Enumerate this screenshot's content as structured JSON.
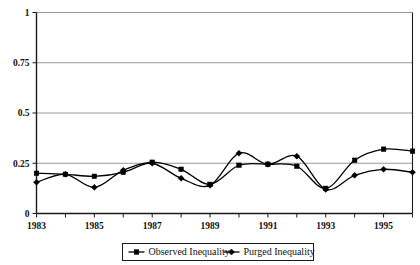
{
  "chart_data": {
    "type": "line",
    "title": "",
    "xlabel": "",
    "ylabel": "",
    "x": [
      1983,
      1984,
      1985,
      1986,
      1987,
      1988,
      1989,
      1990,
      1991,
      1992,
      1993,
      1994,
      1995,
      1996
    ],
    "xlim": [
      1983,
      1996
    ],
    "ylim": [
      0,
      1
    ],
    "yticks": [
      "0",
      "0.25",
      "0.5",
      "0.75",
      "1"
    ],
    "ytick_values": [
      0,
      0.25,
      0.5,
      0.75,
      1
    ],
    "xticks": [
      "1983",
      "1985",
      "1987",
      "1989",
      "1991",
      "1993",
      "1995"
    ],
    "xtick_values": [
      1983,
      1985,
      1987,
      1989,
      1991,
      1993,
      1995
    ],
    "grid": "horizontal",
    "legend_position": "bottom-center",
    "smoothing": "spline",
    "series": [
      {
        "name": "Observed Inequality",
        "marker": "square",
        "color": "#000000",
        "values": [
          0.2,
          0.195,
          0.185,
          0.205,
          0.255,
          0.22,
          0.145,
          0.24,
          0.245,
          0.235,
          0.125,
          0.265,
          0.32,
          0.31
        ]
      },
      {
        "name": "Purged Inequality",
        "marker": "diamond",
        "color": "#000000",
        "values": [
          0.155,
          0.195,
          0.13,
          0.215,
          0.25,
          0.175,
          0.14,
          0.3,
          0.245,
          0.285,
          0.12,
          0.19,
          0.22,
          0.205
        ]
      }
    ]
  },
  "legend": {
    "items": [
      {
        "label": "Observed Inequality",
        "marker": "square"
      },
      {
        "label": "Purged Inequality",
        "marker": "diamond"
      }
    ]
  },
  "colors": {
    "line": "#000000",
    "grid": "#8c8c8c",
    "axis": "#1a1a1a",
    "background": "#ffffff"
  }
}
